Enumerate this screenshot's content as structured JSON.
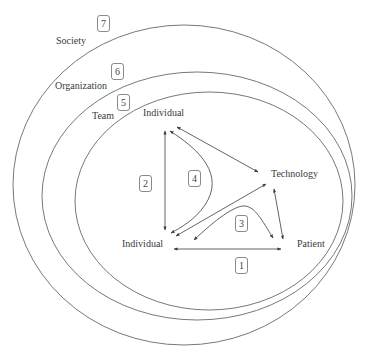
{
  "levels": [
    {
      "number": "7",
      "label": "Society"
    },
    {
      "number": "6",
      "label": "Organization"
    },
    {
      "number": "5",
      "label": "Team"
    }
  ],
  "nodes": {
    "individual_top": "Individual",
    "technology": "Technology",
    "individual_bottom": "Individual",
    "patient": "Patient"
  },
  "interactions": [
    {
      "number": "1",
      "from": "Individual",
      "to": "Patient"
    },
    {
      "number": "2",
      "from": "Individual",
      "to": "Individual"
    },
    {
      "number": "3",
      "from": "Individual",
      "to": "Patient",
      "via": "Technology"
    },
    {
      "number": "4",
      "from": "Individual",
      "to": "Individual",
      "via": "Technology"
    }
  ],
  "colors": {
    "line": "#3c3c3c",
    "text": "#3a3a3a",
    "box_border": "#8a8a8a"
  }
}
